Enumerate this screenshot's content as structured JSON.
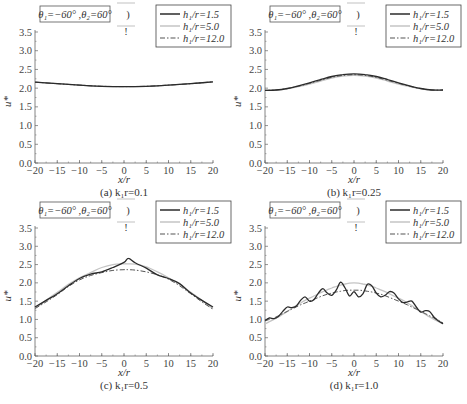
{
  "figure": {
    "width": 467,
    "height": 404,
    "colors": {
      "h1_5": "#2b2b2b",
      "h5_0": "#c4c4c4",
      "h12_0": "#555555",
      "axis": "#666666"
    }
  },
  "chart_data": [
    {
      "type": "line",
      "panel": "a",
      "caption": "(a) k₁r=0.1",
      "annotation": "θ₁=−60° ,θ₂=60°",
      "xlabel": "x/r",
      "ylabel": "u*",
      "xlim": [
        -20,
        20
      ],
      "ylim": [
        0,
        3.5
      ],
      "xticks": [
        -20,
        -15,
        -10,
        -5,
        0,
        5,
        10,
        15,
        20
      ],
      "yticks": [
        0.0,
        0.5,
        1.0,
        1.5,
        2.0,
        2.5,
        3.0,
        3.5
      ],
      "grid": false,
      "legend_position": "upper right",
      "x": [
        -20,
        -15,
        -10,
        -5,
        0,
        5,
        10,
        15,
        20
      ],
      "series": [
        {
          "name": "h₁/r=1.5",
          "style": "solid",
          "values": [
            2.16,
            2.12,
            2.08,
            2.05,
            2.04,
            2.05,
            2.08,
            2.12,
            2.17
          ]
        },
        {
          "name": "h₁/r=5.0",
          "style": "solid-light",
          "values": [
            2.16,
            2.12,
            2.08,
            2.05,
            2.04,
            2.05,
            2.08,
            2.12,
            2.17
          ]
        },
        {
          "name": "h₁/r=12.0",
          "style": "dash-dot",
          "values": [
            2.16,
            2.12,
            2.08,
            2.05,
            2.04,
            2.05,
            2.08,
            2.12,
            2.17
          ]
        }
      ]
    },
    {
      "type": "line",
      "panel": "b",
      "caption": "(b) k₁r=0.25",
      "annotation": "θ₁=−60° ,θ₂=60°",
      "xlabel": "x/r",
      "ylabel": "u*",
      "xlim": [
        -20,
        20
      ],
      "ylim": [
        0,
        3.5
      ],
      "xticks": [
        -20,
        -15,
        -10,
        -5,
        0,
        5,
        10,
        15,
        20
      ],
      "yticks": [
        0.0,
        0.5,
        1.0,
        1.5,
        2.0,
        2.5,
        3.0,
        3.5
      ],
      "grid": false,
      "legend_position": "upper right",
      "x": [
        -20,
        -17.5,
        -15,
        -12.5,
        -10,
        -7.5,
        -5,
        -2.5,
        0,
        2.5,
        5,
        7.5,
        10,
        12.5,
        15,
        17.5,
        20
      ],
      "series": [
        {
          "name": "h₁/r=1.5",
          "style": "solid",
          "values": [
            1.94,
            1.95,
            1.99,
            2.06,
            2.14,
            2.23,
            2.31,
            2.36,
            2.38,
            2.36,
            2.31,
            2.23,
            2.14,
            2.06,
            1.99,
            1.95,
            1.95
          ]
        },
        {
          "name": "h₁/r=5.0",
          "style": "solid-light",
          "values": [
            1.94,
            1.95,
            1.98,
            2.04,
            2.11,
            2.19,
            2.27,
            2.32,
            2.34,
            2.32,
            2.27,
            2.19,
            2.11,
            2.04,
            1.98,
            1.95,
            1.95
          ]
        },
        {
          "name": "h₁/r=12.0",
          "style": "dash-dot",
          "values": [
            1.94,
            1.95,
            1.99,
            2.05,
            2.13,
            2.21,
            2.29,
            2.34,
            2.36,
            2.34,
            2.29,
            2.21,
            2.13,
            2.05,
            1.99,
            1.95,
            1.95
          ]
        }
      ]
    },
    {
      "type": "line",
      "panel": "c",
      "caption": "(c) k₁r=0.5",
      "annotation": "θ₁=−60° ,θ₂=60°",
      "xlabel": "x/r",
      "ylabel": "u*",
      "xlim": [
        -20,
        20
      ],
      "ylim": [
        0,
        3.5
      ],
      "xticks": [
        -20,
        -15,
        -10,
        -5,
        0,
        5,
        10,
        15,
        20
      ],
      "yticks": [
        0.0,
        0.5,
        1.0,
        1.5,
        2.0,
        2.5,
        3.0,
        3.5
      ],
      "grid": false,
      "legend_position": "upper right",
      "x": [
        -20,
        -17.5,
        -15,
        -12.5,
        -10,
        -7.5,
        -5,
        -2.5,
        0,
        1,
        2.5,
        5,
        7.5,
        10,
        12.5,
        15,
        17.5,
        20
      ],
      "series": [
        {
          "name": "h₁/r=1.5",
          "style": "solid",
          "values": [
            1.34,
            1.52,
            1.7,
            1.92,
            2.12,
            2.24,
            2.3,
            2.42,
            2.56,
            2.67,
            2.55,
            2.4,
            2.22,
            2.12,
            1.98,
            1.72,
            1.52,
            1.34
          ]
        },
        {
          "name": "h₁/r=5.0",
          "style": "solid-light",
          "values": [
            1.3,
            1.52,
            1.74,
            1.96,
            2.14,
            2.28,
            2.42,
            2.5,
            2.52,
            2.52,
            2.51,
            2.44,
            2.3,
            2.14,
            1.96,
            1.74,
            1.52,
            1.3
          ]
        },
        {
          "name": "h₁/r=12.0",
          "style": "dash-dot",
          "values": [
            1.3,
            1.48,
            1.68,
            1.9,
            2.08,
            2.2,
            2.28,
            2.34,
            2.36,
            2.36,
            2.35,
            2.3,
            2.22,
            2.1,
            1.92,
            1.7,
            1.48,
            1.28
          ]
        }
      ]
    },
    {
      "type": "line",
      "panel": "d",
      "caption": "(d) k₁r=1.0",
      "annotation": "θ₁=−60° ,θ₂=60°",
      "xlabel": "x/r",
      "ylabel": "u*",
      "xlim": [
        -20,
        20
      ],
      "ylim": [
        0,
        3.5
      ],
      "xticks": [
        -20,
        -15,
        -10,
        -5,
        0,
        5,
        10,
        15,
        20
      ],
      "yticks": [
        0.0,
        0.5,
        1.0,
        1.5,
        2.0,
        2.5,
        3.0,
        3.5
      ],
      "grid": false,
      "legend_position": "upper right",
      "x": [
        -20,
        -19,
        -18,
        -17,
        -16,
        -15,
        -14,
        -13,
        -12,
        -11,
        -10,
        -9,
        -8,
        -7,
        -6,
        -5,
        -4,
        -3,
        -2,
        -1,
        0,
        1,
        2,
        3,
        4,
        5,
        6,
        7,
        8,
        9,
        10,
        11,
        12,
        13,
        14,
        15,
        16,
        17,
        18,
        19,
        20
      ],
      "series": [
        {
          "name": "h₁/r=1.5",
          "style": "solid",
          "values": [
            0.97,
            1.04,
            1.02,
            1.08,
            1.22,
            1.34,
            1.32,
            1.36,
            1.52,
            1.62,
            1.5,
            1.54,
            1.72,
            1.84,
            1.72,
            1.66,
            1.8,
            2.02,
            1.86,
            1.64,
            1.76,
            1.62,
            1.7,
            1.96,
            1.92,
            1.72,
            1.62,
            1.66,
            1.76,
            1.72,
            1.56,
            1.46,
            1.48,
            1.5,
            1.34,
            1.2,
            1.24,
            1.22,
            1.06,
            0.96,
            0.88
          ]
        },
        {
          "name": "h₁/r=5.0",
          "style": "solid-light",
          "values": [
            0.88,
            0.94,
            1.0,
            1.07,
            1.14,
            1.22,
            1.3,
            1.38,
            1.45,
            1.52,
            1.58,
            1.64,
            1.7,
            1.76,
            1.81,
            1.86,
            1.9,
            1.94,
            1.97,
            1.99,
            2.0,
            1.99,
            1.97,
            1.94,
            1.9,
            1.86,
            1.81,
            1.76,
            1.7,
            1.64,
            1.58,
            1.52,
            1.45,
            1.38,
            1.3,
            1.22,
            1.14,
            1.07,
            1.0,
            0.94,
            0.88
          ]
        },
        {
          "name": "h₁/r=12.0",
          "style": "dash-dot",
          "values": [
            0.96,
            1.0,
            1.04,
            1.1,
            1.16,
            1.22,
            1.28,
            1.34,
            1.4,
            1.45,
            1.5,
            1.55,
            1.6,
            1.65,
            1.69,
            1.72,
            1.75,
            1.77,
            1.79,
            1.8,
            1.8,
            1.8,
            1.79,
            1.77,
            1.75,
            1.72,
            1.69,
            1.65,
            1.6,
            1.55,
            1.5,
            1.45,
            1.4,
            1.34,
            1.28,
            1.22,
            1.16,
            1.1,
            1.04,
            0.98,
            0.9
          ]
        }
      ]
    }
  ],
  "panels": [
    {
      "id": "a",
      "caption": "(a) k₁r=0.1"
    },
    {
      "id": "b",
      "caption": "(b) k₁r=0.25"
    },
    {
      "id": "c",
      "caption": "(c) k₁r=0.5"
    },
    {
      "id": "d",
      "caption": "(d) k₁r=1.0"
    }
  ],
  "legend": {
    "items": [
      "h₁/r=1.5",
      "h₁/r=5.0",
      "h₁/r=12.0"
    ]
  },
  "inset_glyph": {
    "paren": ")",
    "bar": "!"
  }
}
